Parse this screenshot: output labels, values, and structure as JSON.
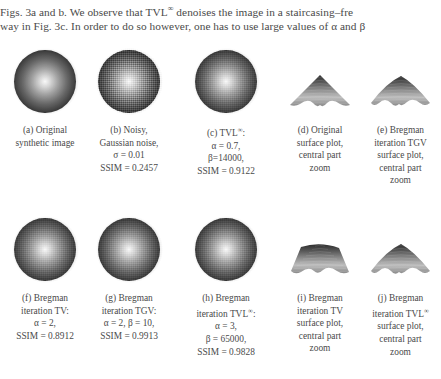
{
  "page": {
    "body_text": {
      "line1_parts": [
        "Figs. 3a and b. We observe that TVL",
        "∞",
        " denoises the image in a staircasing–fre"
      ],
      "line2": "way in Fig. 3c. In order to do so however, one has to use large values of α and β"
    }
  },
  "figure": {
    "rows": [
      {
        "cells": [
          {
            "id": "a",
            "kind": "image",
            "style": "original",
            "caption": [
              "(a) Original",
              "synthetic image"
            ]
          },
          {
            "id": "b",
            "kind": "image",
            "style": "noisy",
            "caption": [
              "(b) Noisy,",
              "Gaussian noise,",
              "σ = 0.01",
              "SSIM = 0.2457"
            ]
          },
          {
            "id": "c",
            "kind": "image",
            "style": "denoised",
            "caption": [
              "(c) TVL∞:",
              "α = 0.7,",
              "β=14000,",
              "SSIM = 0.9122"
            ]
          },
          {
            "id": "d",
            "kind": "surface",
            "style": "peak-sharp",
            "caption": [
              "(d) Original",
              "surface plot,",
              "central part",
              "zoom"
            ]
          },
          {
            "id": "e",
            "kind": "surface",
            "style": "peak-round",
            "caption": [
              "(e) Bregman",
              "iteration TGV",
              "surface plot,",
              "central part",
              "zoom"
            ]
          }
        ]
      },
      {
        "cells": [
          {
            "id": "f",
            "kind": "image",
            "style": "denoised",
            "caption": [
              "(f) Bregman",
              "iteration TV:",
              "α = 2,",
              "SSIM = 0.8912"
            ]
          },
          {
            "id": "g",
            "kind": "image",
            "style": "denoised",
            "caption": [
              "(g) Bregman",
              "iteration TGV:",
              "α = 2, β = 10,",
              "SSIM = 0.9913"
            ]
          },
          {
            "id": "h",
            "kind": "image",
            "style": "denoised",
            "caption": [
              "(h) Bregman",
              "iteration TVL∞:",
              "α = 3,",
              "β = 65000,",
              "SSIM = 0.9828"
            ]
          },
          {
            "id": "i",
            "kind": "surface",
            "style": "peak-flat",
            "caption": [
              "(i) Bregman",
              "iteration TV",
              "surface plot,",
              "central part",
              "zoom"
            ]
          },
          {
            "id": "j",
            "kind": "surface",
            "style": "peak-round",
            "caption": [
              "(j) Bregman",
              "iteration TVL∞",
              "surface plot,",
              "central part",
              "zoom"
            ]
          }
        ]
      }
    ]
  },
  "colors": {
    "page_background": "#ffffff",
    "text": "#4a4a4a",
    "image_dark": "#121212",
    "image_light": "#f2f2f2"
  }
}
